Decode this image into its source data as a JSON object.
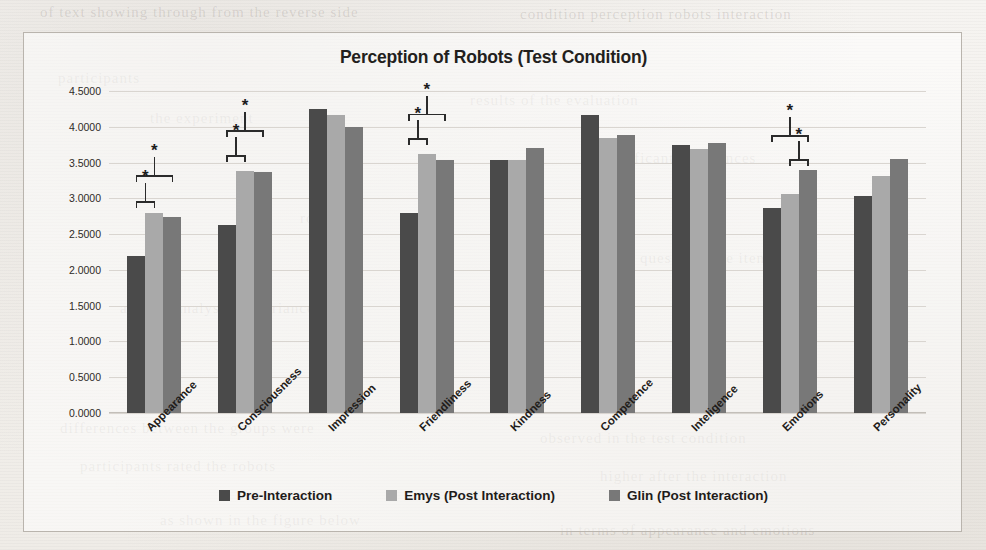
{
  "chart_data": {
    "type": "bar",
    "title": "Perception of Robots (Test Condition)",
    "xlabel": "",
    "ylabel": "",
    "ylim": [
      0,
      4.5
    ],
    "grid": true,
    "legend_position": "bottom",
    "ytick_labels": [
      "4.5000",
      "4.0000",
      "3.5000",
      "3.0000",
      "2.5000",
      "2.0000",
      "1.5000",
      "1.0000",
      "0.5000",
      "0.0000"
    ],
    "ytick_values": [
      4.5,
      4.0,
      3.5,
      3.0,
      2.5,
      2.0,
      1.5,
      1.0,
      0.5,
      0.0
    ],
    "categories": [
      "Appearance",
      "Consciousness",
      "Impression",
      "Friendliness",
      "Kindness",
      "Competence",
      "Inteligence",
      "Emotions",
      "Personality"
    ],
    "series": [
      {
        "name": "Pre-Interaction",
        "color": "#4a4a4a",
        "values": [
          2.2,
          2.63,
          4.25,
          2.8,
          3.54,
          4.16,
          3.74,
          2.86,
          3.03
        ]
      },
      {
        "name": "Emys (Post Interaction)",
        "color": "#a9a9a9",
        "values": [
          2.8,
          3.38,
          4.17,
          3.62,
          3.53,
          3.84,
          3.69,
          3.06,
          3.31
        ]
      },
      {
        "name": "Glin (Post Interaction)",
        "color": "#787878",
        "values": [
          2.74,
          3.37,
          4.0,
          3.54,
          3.7,
          3.88,
          3.78,
          3.4,
          3.55
        ]
      }
    ],
    "annotations": [
      {
        "category": "Appearance",
        "from_series": 0,
        "to_series": 2,
        "label": "*",
        "level": 3.32
      },
      {
        "category": "Appearance",
        "from_series": 0,
        "to_series": 1,
        "label": "*",
        "level": 2.96
      },
      {
        "category": "Consciousness",
        "from_series": 0,
        "to_series": 2,
        "label": "*",
        "level": 3.95
      },
      {
        "category": "Consciousness",
        "from_series": 0,
        "to_series": 1,
        "label": "*",
        "level": 3.6
      },
      {
        "category": "Friendliness",
        "from_series": 0,
        "to_series": 2,
        "label": "*",
        "level": 4.18
      },
      {
        "category": "Friendliness",
        "from_series": 0,
        "to_series": 1,
        "label": "*",
        "level": 3.84
      },
      {
        "category": "Emotions",
        "from_series": 0,
        "to_series": 2,
        "label": "*",
        "level": 3.88
      },
      {
        "category": "Emotions",
        "from_series": 1,
        "to_series": 2,
        "label": "*",
        "level": 3.55
      }
    ]
  },
  "legend": {
    "items": [
      {
        "label": "Pre-Interaction",
        "color": "#4a4a4a"
      },
      {
        "label": "Emys (Post Interaction)",
        "color": "#a9a9a9"
      },
      {
        "label": "Glin (Post Interaction)",
        "color": "#787878"
      }
    ]
  },
  "background_bleed": [
    {
      "text": "of text showing through from the reverse side",
      "x": 40,
      "y": 4
    },
    {
      "text": "condition perception robots interaction",
      "x": 520,
      "y": 6
    },
    {
      "text": "participants",
      "x": 58,
      "y": 70
    },
    {
      "text": "the experiment",
      "x": 150,
      "y": 110
    },
    {
      "text": "results of the evaluation",
      "x": 470,
      "y": 92
    },
    {
      "text": "significant differences",
      "x": 600,
      "y": 150
    },
    {
      "text": "robot",
      "x": 300,
      "y": 210
    },
    {
      "text": "questionnaire items",
      "x": 640,
      "y": 250
    },
    {
      "text": "and the analysis of variance",
      "x": 120,
      "y": 300
    },
    {
      "text": "differences between the groups were",
      "x": 60,
      "y": 420
    },
    {
      "text": "observed in the test condition",
      "x": 540,
      "y": 430
    },
    {
      "text": "participants rated the robots",
      "x": 80,
      "y": 458
    },
    {
      "text": "higher after the interaction",
      "x": 600,
      "y": 468
    },
    {
      "text": "as shown in the figure below",
      "x": 160,
      "y": 512
    },
    {
      "text": "in terms of appearance and emotions",
      "x": 560,
      "y": 522
    }
  ]
}
